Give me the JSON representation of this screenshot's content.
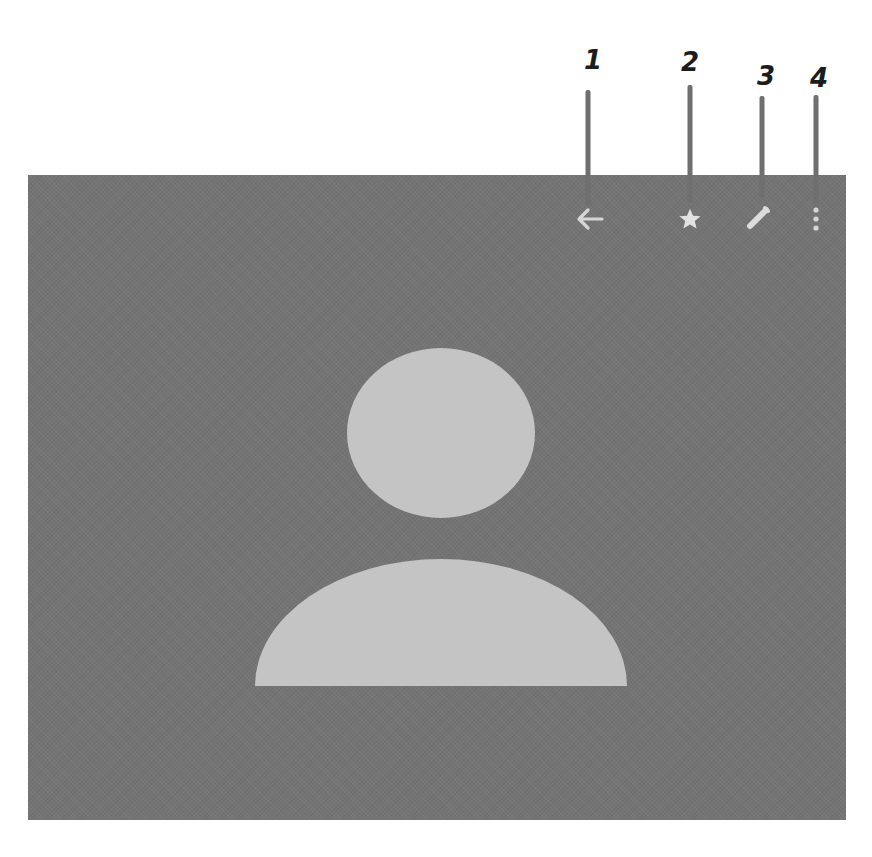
{
  "annotations": [
    {
      "number": "1",
      "target": "back-button",
      "x": 590,
      "label_y": 50,
      "line_top": 90,
      "line_bottom": 205
    },
    {
      "number": "2",
      "target": "favorite-button",
      "x": 690,
      "label_y": 50,
      "line_top": 85,
      "line_bottom": 205
    },
    {
      "number": "3",
      "target": "edit-button",
      "x": 762,
      "label_y": 65,
      "line_top": 95,
      "line_bottom": 200
    },
    {
      "number": "4",
      "target": "more-options-button",
      "x": 816,
      "label_y": 65,
      "line_top": 95,
      "line_bottom": 215
    }
  ],
  "toolbar": {
    "icons": [
      {
        "name": "back-arrow-icon",
        "glyph": "arrow-left"
      },
      {
        "name": "star-icon",
        "glyph": "star"
      },
      {
        "name": "pencil-icon",
        "glyph": "pencil"
      },
      {
        "name": "more-vert-icon",
        "glyph": "three-dots-vertical"
      }
    ]
  },
  "contact": {
    "avatar": "default-person-placeholder"
  },
  "colors": {
    "panel_background": "#747474",
    "avatar_fill": "#c4c4c4",
    "icon_color": "#d6d6d6",
    "callout_line": "#6f6f6f",
    "callout_text": "#1c1c1c"
  }
}
